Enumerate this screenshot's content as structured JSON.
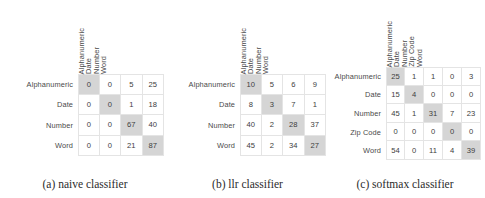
{
  "figure": {
    "panels": [
      {
        "id": "naive",
        "caption": "(a) naive classifier",
        "col_headers": [
          "Alphanumeric",
          "Date",
          "Number",
          "Word"
        ],
        "row_labels": [
          "Alphanumeric",
          "Date",
          "Number",
          "Word"
        ],
        "rows": [
          [
            "0",
            "0",
            "5",
            "25"
          ],
          [
            "0",
            "0",
            "1",
            "18"
          ],
          [
            "0",
            "0",
            "67",
            "40"
          ],
          [
            "0",
            "0",
            "21",
            "87"
          ]
        ]
      },
      {
        "id": "llr",
        "caption": "(b) llr classifier",
        "col_headers": [
          "Alphanumeric",
          "Date",
          "Number",
          "Word"
        ],
        "row_labels": [
          "Alphanumeric",
          "Date",
          "Number",
          "Word"
        ],
        "rows": [
          [
            "10",
            "5",
            "6",
            "9"
          ],
          [
            "8",
            "3",
            "7",
            "1"
          ],
          [
            "40",
            "2",
            "28",
            "37"
          ],
          [
            "45",
            "2",
            "34",
            "27"
          ]
        ]
      },
      {
        "id": "softmax",
        "caption": "(c) softmax classifier",
        "col_headers": [
          "Alphanumeric",
          "Date",
          "Number",
          "Zip Code",
          "Word"
        ],
        "row_labels": [
          "Alphanumeric",
          "Date",
          "Number",
          "Zip Code",
          "Word"
        ],
        "rows": [
          [
            "25",
            "1",
            "1",
            "0",
            "3"
          ],
          [
            "15",
            "4",
            "0",
            "0",
            "0"
          ],
          [
            "45",
            "1",
            "31",
            "7",
            "23"
          ],
          [
            "0",
            "0",
            "0",
            "0",
            "0"
          ],
          [
            "54",
            "0",
            "11",
            "4",
            "39"
          ]
        ]
      }
    ],
    "colors": {
      "background": "#ffffff",
      "diagonal_highlight": "#d5d5d5",
      "cell_background": "#ffffff",
      "grid_line": "#e4e4e4",
      "text": "#3d3d3d"
    }
  },
  "chart_data": {
    "type": "heatmap",
    "title": "",
    "subtitle": "",
    "xlabel": "",
    "ylabel": "",
    "grid": true,
    "legend_position": "none",
    "note": "Three confusion matrices rendered as tables; diagonal (correct-prediction) cells are shaded gray.",
    "matrices": [
      {
        "name": "naive classifier",
        "caption": "(a) naive classifier",
        "columns": [
          "Alphanumeric",
          "Date",
          "Number",
          "Word"
        ],
        "rows": [
          "Alphanumeric",
          "Date",
          "Number",
          "Word"
        ],
        "values": [
          [
            0,
            0,
            5,
            25
          ],
          [
            0,
            0,
            1,
            18
          ],
          [
            0,
            0,
            67,
            40
          ],
          [
            0,
            0,
            21,
            87
          ]
        ]
      },
      {
        "name": "llr classifier",
        "caption": "(b) llr classifier",
        "columns": [
          "Alphanumeric",
          "Date",
          "Number",
          "Word"
        ],
        "rows": [
          "Alphanumeric",
          "Date",
          "Number",
          "Word"
        ],
        "values": [
          [
            10,
            5,
            6,
            9
          ],
          [
            8,
            3,
            7,
            1
          ],
          [
            40,
            2,
            28,
            37
          ],
          [
            45,
            2,
            34,
            27
          ]
        ]
      },
      {
        "name": "softmax classifier",
        "caption": "(c) softmax classifier",
        "columns": [
          "Alphanumeric",
          "Date",
          "Number",
          "Zip Code",
          "Word"
        ],
        "rows": [
          "Alphanumeric",
          "Date",
          "Number",
          "Zip Code",
          "Word"
        ],
        "values": [
          [
            25,
            1,
            1,
            0,
            3
          ],
          [
            15,
            4,
            0,
            0,
            0
          ],
          [
            45,
            1,
            31,
            7,
            23
          ],
          [
            0,
            0,
            0,
            0,
            0
          ],
          [
            54,
            0,
            11,
            4,
            39
          ]
        ]
      }
    ]
  }
}
